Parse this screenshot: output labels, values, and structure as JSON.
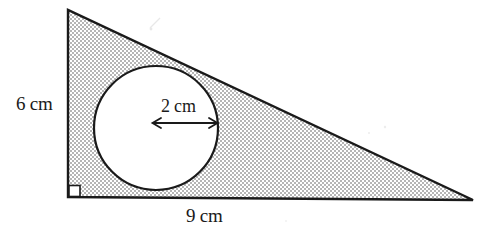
{
  "figure": {
    "background_color": "#ffffff",
    "outline_color": "#1a1a1a",
    "shading_color": "#b9b9b9",
    "circle_fill_color": "#ffffff"
  },
  "labels": {
    "height": "6 cm",
    "base": "9 cm",
    "radius": "2 cm"
  },
  "shapes": {
    "triangle": {
      "name": "shaded-right-triangle",
      "apex": [
        68,
        10
      ],
      "right_angle_vertex": [
        68,
        197
      ],
      "right_vertex": [
        473,
        200
      ],
      "vertical_leg_label": "6 cm",
      "horizontal_leg_label": "9 cm",
      "right_angle_marker_size": 11
    },
    "circle": {
      "name": "inscribed-circle",
      "center": [
        156,
        128
      ],
      "radius": 62,
      "radius_label": "2 cm"
    },
    "radius_arrow": {
      "name": "radius-dimension-arrow",
      "from": [
        152,
        123
      ],
      "to": [
        218,
        123
      ],
      "double_headed": true
    }
  }
}
